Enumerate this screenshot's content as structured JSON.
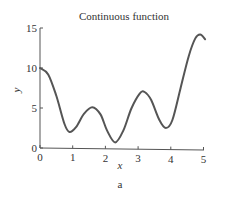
{
  "figure": {
    "caption": "a"
  },
  "chart_data": {
    "type": "line",
    "title": "Continuous function",
    "xlabel": "x",
    "ylabel": "y",
    "xlim": [
      0,
      5
    ],
    "ylim": [
      0,
      15
    ],
    "xticks": [
      0,
      1,
      2,
      3,
      4,
      5
    ],
    "yticks": [
      0,
      5,
      10,
      15
    ],
    "xtick_labels": [
      "0",
      "1",
      "2",
      "3",
      "4",
      "5"
    ],
    "ytick_labels": [
      "0",
      "5",
      "10",
      "15"
    ],
    "grid": false,
    "legend": null,
    "series": [
      {
        "name": "continuous function",
        "color": "#555555",
        "x": [
          0,
          0.25,
          0.5,
          0.75,
          0.9,
          1.1,
          1.35,
          1.6,
          1.85,
          2.05,
          2.3,
          2.55,
          2.8,
          3.05,
          3.2,
          3.4,
          3.65,
          3.85,
          4.05,
          4.3,
          4.55,
          4.75,
          4.9,
          5.05
        ],
        "y": [
          10,
          9.2,
          6.5,
          3.0,
          2.0,
          2.6,
          4.3,
          5.1,
          4.2,
          2.2,
          0.7,
          2.2,
          5.0,
          6.8,
          7.0,
          6.0,
          3.5,
          2.5,
          3.5,
          7.5,
          11.5,
          13.7,
          14.2,
          13.6
        ]
      }
    ]
  }
}
